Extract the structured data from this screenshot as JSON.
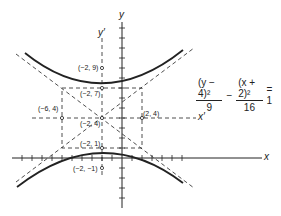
{
  "equation": {
    "term1_numerator": "(y − 4)²",
    "term1_denominator": "9",
    "minus": "−",
    "term2_numerator": "(x + 2)²",
    "term2_denominator": "16",
    "rhs": "= 1"
  },
  "axes": {
    "x": "x",
    "y": "y",
    "x_prime": "x′",
    "y_prime": "y′"
  },
  "points": {
    "p1": "(−2, 9)",
    "p2": "(−2, 7)",
    "p3": "(−6, 4)",
    "p4": "(2, 4)",
    "p5": "(−2, 4)",
    "p6": "(−2, 1)",
    "p7": "(−2, −1)"
  },
  "colors": {
    "ink": "#222222",
    "background": "#ffffff"
  }
}
